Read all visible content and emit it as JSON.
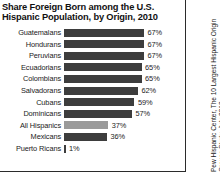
{
  "chart_data": {
    "type": "bar",
    "orientation": "horizontal",
    "title": "Share Foreign Born among the U.S. Hispanic Population, by Origin, 2010",
    "title_lines": [
      "Share Foreign Born among the U.S.",
      "Hispanic Population, by Origin, 2010"
    ],
    "xlabel": "",
    "ylabel": "",
    "xlim": [
      0,
      100
    ],
    "grid": false,
    "legend": null,
    "categories": [
      "Guatemalans",
      "Hondurans",
      "Peruvians",
      "Ecuadorians",
      "Colombians",
      "Salvadorans",
      "Cubans",
      "Dominicans",
      "All Hispanics",
      "Mexicans",
      "Puerto Ricans"
    ],
    "values": [
      67,
      67,
      67,
      65,
      65,
      62,
      59,
      57,
      37,
      36,
      1
    ],
    "value_labels": [
      "67%",
      "67%",
      "67%",
      "65%",
      "65%",
      "62%",
      "59%",
      "57%",
      "37%",
      "36%",
      "1%"
    ],
    "bar_colors": [
      "#3d3d3d",
      "#3d3d3d",
      "#3d3d3d",
      "#3d3d3d",
      "#3d3d3d",
      "#3d3d3d",
      "#3d3d3d",
      "#3d3d3d",
      "#9a9a9a",
      "#3d3d3d",
      "#3d3d3d"
    ],
    "highlight_category": "All Hispanics",
    "highlight_color": "#9a9a9a",
    "bar_color": "#3d3d3d",
    "background_color": "#ffffff"
  },
  "source": {
    "text": "Pew Hispanic Center, The 10 Largest Hispanic Origin Groups Study, July 2012"
  }
}
